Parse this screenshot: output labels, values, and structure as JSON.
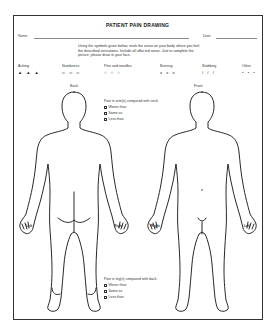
{
  "form": {
    "title": "PATIENT PAIN DRAWING",
    "name_label": "Name",
    "date_label": "Date",
    "instructions": "Using the symbols given below, mark the areas on your body where you feel the described sensations. Include all affected areas. Just to complete the picture, please draw in your face."
  },
  "legend": [
    {
      "label": "Aching",
      "symbol": "▲ ▲ ▲",
      "icon": "triangle-icon"
    },
    {
      "label": "Numbness",
      "symbol": "═ ═ ═",
      "icon": "dash-icon"
    },
    {
      "label": "Pins and needles",
      "symbol": "○ ○ ○",
      "icon": "circle-icon"
    },
    {
      "label": "Burning",
      "symbol": "x x x",
      "icon": "x-mark-icon"
    },
    {
      "label": "Stabbing",
      "symbol": "/ / /",
      "icon": "slash-icon"
    },
    {
      "label": "Other",
      "symbol": "• • •",
      "icon": "dot-icon"
    }
  ],
  "views": {
    "back": {
      "label": "Back",
      "left_hand": "Left",
      "right_hand": "Right"
    },
    "front": {
      "label": "Front",
      "left_hand": "Left",
      "right_hand": "Right"
    }
  },
  "questions": {
    "arms": {
      "prompt": "Pain in arm(s) compared with neck",
      "options": [
        "Worse than",
        "Same as",
        "Less than"
      ]
    },
    "legs": {
      "prompt": "Pain in leg(s) compared with back",
      "options": [
        "Worse than",
        "Same as",
        "Less than"
      ]
    }
  }
}
